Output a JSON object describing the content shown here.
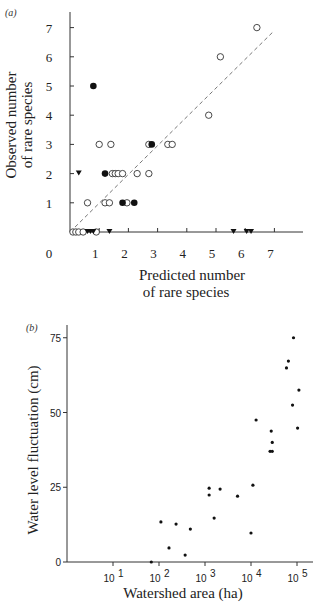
{
  "chart_data": [
    {
      "panel": "(a)",
      "type": "scatter",
      "title": "",
      "xlabel": "Predicted number of rare species",
      "xlabel_lines": [
        "Predicted number",
        "of rare species"
      ],
      "ylabel": "Observed number of rare species",
      "ylabel_lines": [
        "Observed number",
        "of rare species"
      ],
      "xlim": [
        0,
        7.6
      ],
      "ylim": [
        0,
        7.5
      ],
      "xticks": [
        1,
        2,
        3,
        4,
        5,
        6,
        7
      ],
      "yticks": [
        1,
        2,
        3,
        4,
        5,
        6,
        7
      ],
      "origin_label": "0",
      "grid": false,
      "reference_line": {
        "style": "dashed",
        "from": [
          0,
          0
        ],
        "to": [
          7,
          6.9
        ],
        "description": "1:1 line"
      },
      "series": [
        {
          "name": "open circles",
          "marker": "open-circle",
          "points": [
            [
              0.1,
              0
            ],
            [
              0.2,
              0
            ],
            [
              0.3,
              0
            ],
            [
              0.45,
              0
            ],
            [
              0.9,
              0
            ],
            [
              0.6,
              1
            ],
            [
              1.2,
              1
            ],
            [
              1.35,
              1
            ],
            [
              1.95,
              1
            ],
            [
              1.45,
              2
            ],
            [
              1.55,
              2
            ],
            [
              1.65,
              2
            ],
            [
              1.8,
              2
            ],
            [
              2.3,
              2
            ],
            [
              2.7,
              2
            ],
            [
              1.0,
              3
            ],
            [
              1.4,
              3
            ],
            [
              2.7,
              3
            ],
            [
              3.35,
              3
            ],
            [
              3.5,
              3
            ],
            [
              4.75,
              4
            ],
            [
              5.15,
              6
            ],
            [
              6.4,
              7
            ]
          ]
        },
        {
          "name": "filled circles",
          "marker": "filled-circle",
          "points": [
            [
              0.8,
              5
            ],
            [
              1.2,
              2
            ],
            [
              1.8,
              1
            ],
            [
              2.2,
              1
            ],
            [
              2.8,
              3
            ]
          ]
        },
        {
          "name": "filled triangles",
          "marker": "filled-triangle",
          "points": [
            [
              0.3,
              2
            ],
            [
              0.6,
              0
            ],
            [
              0.7,
              0
            ],
            [
              0.8,
              0
            ],
            [
              1.35,
              0
            ],
            [
              5.6,
              0
            ],
            [
              6.05,
              0
            ],
            [
              6.2,
              0
            ]
          ]
        }
      ]
    },
    {
      "panel": "(b)",
      "type": "scatter",
      "title": "",
      "xlabel": "Watershed area (ha)",
      "ylabel": "Water level fluctuation (cm)",
      "xscale": "log",
      "xlim": [
        1,
        150000
      ],
      "ylim": [
        0,
        80
      ],
      "xticks": [
        "10^1",
        "10^2",
        "10^3",
        "10^4",
        "10^5"
      ],
      "xtick_labels": [
        "10",
        "10",
        "10",
        "10",
        "10"
      ],
      "xtick_exponents": [
        "1",
        "2",
        "3",
        "4",
        "5"
      ],
      "yticks": [
        0,
        25,
        50,
        75
      ],
      "ytick_labels": [
        "0",
        "25",
        "50",
        "75"
      ],
      "grid": false,
      "series": [
        {
          "name": "lakes",
          "marker": "small-filled-dot",
          "points": [
            [
              68,
              0
            ],
            [
              110,
              13.4
            ],
            [
              165,
              4.7
            ],
            [
              235,
              12.7
            ],
            [
              370,
              2.3
            ],
            [
              480,
              11
            ],
            [
              1230,
              24.7
            ],
            [
              1230,
              22.4
            ],
            [
              1580,
              14.7
            ],
            [
              2130,
              24.4
            ],
            [
              5100,
              22
            ],
            [
              10000,
              9.7
            ],
            [
              11000,
              25.7
            ],
            [
              12900,
              47.5
            ],
            [
              26000,
              37
            ],
            [
              27500,
              43.8
            ],
            [
              29000,
              37
            ],
            [
              29000,
              40
            ],
            [
              59000,
              64.9
            ],
            [
              65000,
              67.2
            ],
            [
              84000,
              75
            ],
            [
              80000,
              52.5
            ],
            [
              110000,
              57.5
            ],
            [
              103000,
              44.8
            ]
          ]
        }
      ]
    }
  ],
  "panels": {
    "a": {
      "label": "(a)",
      "origin": "0",
      "x_ticks": [
        "1",
        "2",
        "3",
        "4",
        "5",
        "6",
        "7"
      ],
      "y_ticks": [
        "1",
        "2",
        "3",
        "4",
        "5",
        "6",
        "7"
      ],
      "xlabel_line1": "Predicted number",
      "xlabel_line2": "of rare species",
      "ylabel_line1": "Observed number",
      "ylabel_line2": "of rare species"
    },
    "b": {
      "label": "(b)",
      "y_ticks": [
        "0",
        "25",
        "50",
        "75"
      ],
      "x_tick_base": "10",
      "x_tick_exps": [
        "1",
        "2",
        "3",
        "4",
        "5"
      ],
      "xlabel": "Watershed area (ha)",
      "ylabel": "Water level fluctuation (cm)"
    }
  }
}
